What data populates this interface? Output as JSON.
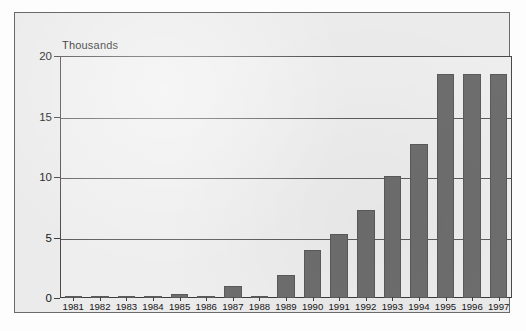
{
  "figure": {
    "unit_label": "Thousands",
    "background_color": "#ebebeb",
    "plot_background_color": "#eeeeee",
    "bar_color": "#6e6e6e",
    "axis_color": "#3f3f3f",
    "grid_color": "#5d5d5d"
  },
  "chart_data": {
    "type": "bar",
    "title": "",
    "subtitle": "",
    "xlabel": "",
    "ylabel": "Thousands",
    "ylim": [
      0,
      20
    ],
    "yticks": [
      0,
      5,
      10,
      15,
      20
    ],
    "ytick_labels": [
      "0",
      "5",
      "10",
      "15",
      "20"
    ],
    "grid": true,
    "grid_axis": "y",
    "legend": false,
    "legend_position": "none",
    "categories": [
      "1981",
      "1982",
      "1983",
      "1984",
      "1985",
      "1986",
      "1987",
      "1988",
      "1989",
      "1990",
      "1991",
      "1992",
      "1993",
      "1994",
      "1995",
      "1996",
      "1997"
    ],
    "values": [
      0.1,
      0.15,
      0.15,
      0.2,
      0.3,
      0.1,
      1.0,
      0.05,
      1.9,
      4.0,
      5.3,
      7.3,
      10.1,
      12.7,
      18.5,
      18.5,
      18.5
    ],
    "annotations": []
  }
}
